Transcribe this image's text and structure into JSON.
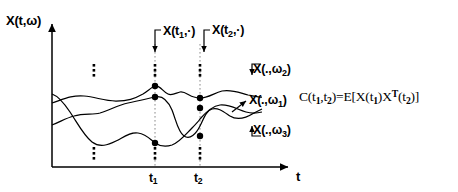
{
  "figure": {
    "type": "stochastic-process-ensemble-diagram",
    "background_color": "#ffffff",
    "ink_color": "#000000",
    "axes": {
      "y_label": "X(t,ω)",
      "x_label": "t",
      "x_ticks": [
        {
          "name": "t1",
          "base": "t",
          "sub": "1",
          "x": 155
        },
        {
          "name": "t2",
          "base": "t",
          "sub": "2",
          "x": 200
        }
      ],
      "origin_x": 52,
      "origin_y": 167,
      "y_top": 20,
      "x_right": 292
    },
    "slice_labels": [
      {
        "base": "X(t",
        "sub": "1",
        "tail": ",·)"
      },
      {
        "base": "X(t",
        "sub": "2",
        "tail": ",·)"
      }
    ],
    "realization_labels": [
      {
        "base": "X(.,ω",
        "sub": "2",
        "tail": ")"
      },
      {
        "base": "X(.,ω",
        "sub": "1",
        "tail": ")"
      },
      {
        "base": "X(.,ω",
        "sub": "3",
        "tail": ")"
      }
    ],
    "formula": {
      "lhs_base": "C(t",
      "lhs_sub1": "1",
      "lhs_mid": ",t",
      "lhs_sub2": "2",
      "eq": ")=E[X(t",
      "sub3": "1",
      "mid2": ")X",
      "sup": "T",
      "mid3": "(t",
      "sub4": "2",
      "tail": ")]",
      "plain": "C(t1,t2)=E[X(t1)X^T(t2)]"
    },
    "ellipses": [
      {
        "name": "vertical-ellipsis-upper-left",
        "x": 94,
        "y": 70
      },
      {
        "name": "vertical-ellipsis-lower-left",
        "x": 94,
        "y": 153
      },
      {
        "name": "vertical-ellipsis-t1-upper",
        "x": 155,
        "y": 70
      },
      {
        "name": "vertical-ellipsis-t1-lower",
        "x": 155,
        "y": 153
      },
      {
        "name": "vertical-ellipsis-t2-upper",
        "x": 200,
        "y": 70
      },
      {
        "name": "vertical-ellipsis-t2-lower",
        "x": 200,
        "y": 153
      }
    ],
    "sample_points": [
      {
        "name": "point-t1-omega2",
        "x": 155,
        "y": 86
      },
      {
        "name": "point-t1-omega1",
        "x": 155,
        "y": 97
      },
      {
        "name": "point-t1-omega3",
        "x": 155,
        "y": 143
      },
      {
        "name": "point-t2-omega2",
        "x": 200,
        "y": 98
      },
      {
        "name": "point-t2-omega1",
        "x": 200,
        "y": 108
      },
      {
        "name": "point-t2-omega3",
        "x": 200,
        "y": 136
      }
    ]
  },
  "chart_data": {
    "type": "line",
    "title": "",
    "xlabel": "t",
    "ylabel": "X(t,ω)",
    "grid": false,
    "legend_position": "right-inline-annotations",
    "xlim": [
      52,
      292
    ],
    "ylim": [
      167,
      20
    ],
    "annotations": [
      "X(t1,·)",
      "X(t2,·)",
      "X(.,ω2)",
      "X(.,ω1)",
      "X(.,ω3)",
      "C(t1,t2)=E[X(t1)X^T(t2)]"
    ],
    "vertical_markers": [
      {
        "label": "t1",
        "x": 155
      },
      {
        "label": "t2",
        "x": 200
      }
    ],
    "series": [
      {
        "name": "X(.,ω2)",
        "marker_values": [
          {
            "x": 155,
            "y": 86
          },
          {
            "x": 200,
            "y": 98
          }
        ],
        "path": "M52,103 C64,99 72,95 84,96 C96,97 104,101 116,101 C128,101 134,99 143,94 C149,90 152,87 155,86 C160,85 163,92 168,94 C172,96 176,93 180,92 C185,91 189,96 194,97 C197,98 198,98 200,98 C208,98 214,93 222,91 C232,89 240,93 248,95 C254,96 258,97 262,97"
      },
      {
        "name": "X(.,ω1)",
        "marker_values": [
          {
            "x": 155,
            "y": 97
          },
          {
            "x": 200,
            "y": 108
          }
        ],
        "path": "M52,125 C60,122 66,118 74,116 C84,113 92,115 100,113 C110,110 118,105 128,103 C138,101 146,99 155,97 C163,95 168,101 172,110 C176,120 178,132 184,136 C190,140 196,134 200,126 C204,118 206,111 212,109 C218,107 224,112 230,116 C238,121 246,118 254,113 C258,111 260,110 262,109"
      },
      {
        "name": "X(.,ω3)",
        "marker_values": [
          {
            "x": 155,
            "y": 143
          },
          {
            "x": 200,
            "y": 136
          }
        ],
        "path": "M52,94 C58,96 64,103 70,112 C78,124 84,136 92,142 C100,148 108,145 116,141 C124,137 130,132 138,133 C146,134 150,139 155,143 C161,147 166,147 172,145 C180,142 186,134 192,128 C196,124 198,122 200,119 C206,112 212,106 220,105 C230,104 238,110 246,112 C253,114 258,113 262,112"
      }
    ]
  }
}
